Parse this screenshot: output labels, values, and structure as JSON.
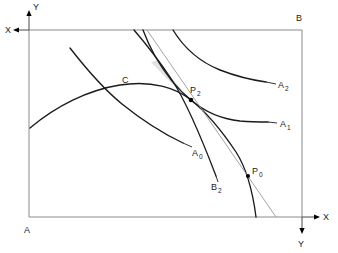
{
  "figure": {
    "type": "diagram",
    "background_color": "#ffffff",
    "frame": {
      "stroke_color": "#8a8a8a",
      "corner_labels": {
        "top_left_inner": "",
        "top_right": "B",
        "bottom_left": "A"
      }
    },
    "axes": [
      {
        "name": "top-left-y",
        "label": "Y",
        "direction": "up"
      },
      {
        "name": "top-left-x",
        "label": "X",
        "direction": "left"
      },
      {
        "name": "bottom-right-x",
        "label": "X",
        "direction": "right"
      },
      {
        "name": "bottom-right-y",
        "label": "Y",
        "direction": "down"
      }
    ],
    "curve_labels": [
      {
        "id": "A2",
        "base": "A",
        "sub": "2"
      },
      {
        "id": "A1",
        "base": "A",
        "sub": "1"
      },
      {
        "id": "A0",
        "base": "A",
        "sub": "0"
      },
      {
        "id": "B2",
        "base": "B",
        "sub": "2"
      },
      {
        "id": "C",
        "base": "C",
        "sub": ""
      }
    ],
    "point_labels": [
      {
        "id": "P2",
        "base": "P",
        "sub": "2"
      },
      {
        "id": "P0",
        "base": "P",
        "sub": "0"
      }
    ],
    "colors": {
      "curve": "#1a1a1a",
      "frame": "#8a8a8a",
      "tangent": "#9a9a9a",
      "shaded_region": "#e2e2e2",
      "text": "#1a1a1a"
    }
  }
}
